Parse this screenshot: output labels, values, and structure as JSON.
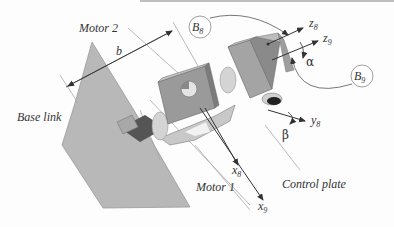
{
  "figure": {
    "labels": {
      "motor2": "Motor 2",
      "motor1": "Motor 1",
      "base_link": "Base link",
      "control_plate": "Control plate",
      "dim_b": "b"
    },
    "frames": {
      "B8": {
        "letter": "B",
        "sub": "8"
      },
      "B9": {
        "letter": "B",
        "sub": "9"
      }
    },
    "axes": {
      "z8": {
        "letter": "z",
        "sub": "8"
      },
      "z9": {
        "letter": "z",
        "sub": "9"
      },
      "y8": {
        "letter": "y",
        "sub": "8"
      },
      "x8": {
        "letter": "x",
        "sub": "8"
      },
      "x9": {
        "letter": "x",
        "sub": "9"
      }
    },
    "angles": {
      "alpha": "α",
      "beta": "β"
    },
    "colors": {
      "base_link": "#b4b4b4",
      "block_front": "#9a9a9a",
      "block_top": "#c8c8c8",
      "block_side": "#7e7e7e",
      "dark_part": "#555555",
      "line": "#333333",
      "leader": "#999999"
    }
  }
}
